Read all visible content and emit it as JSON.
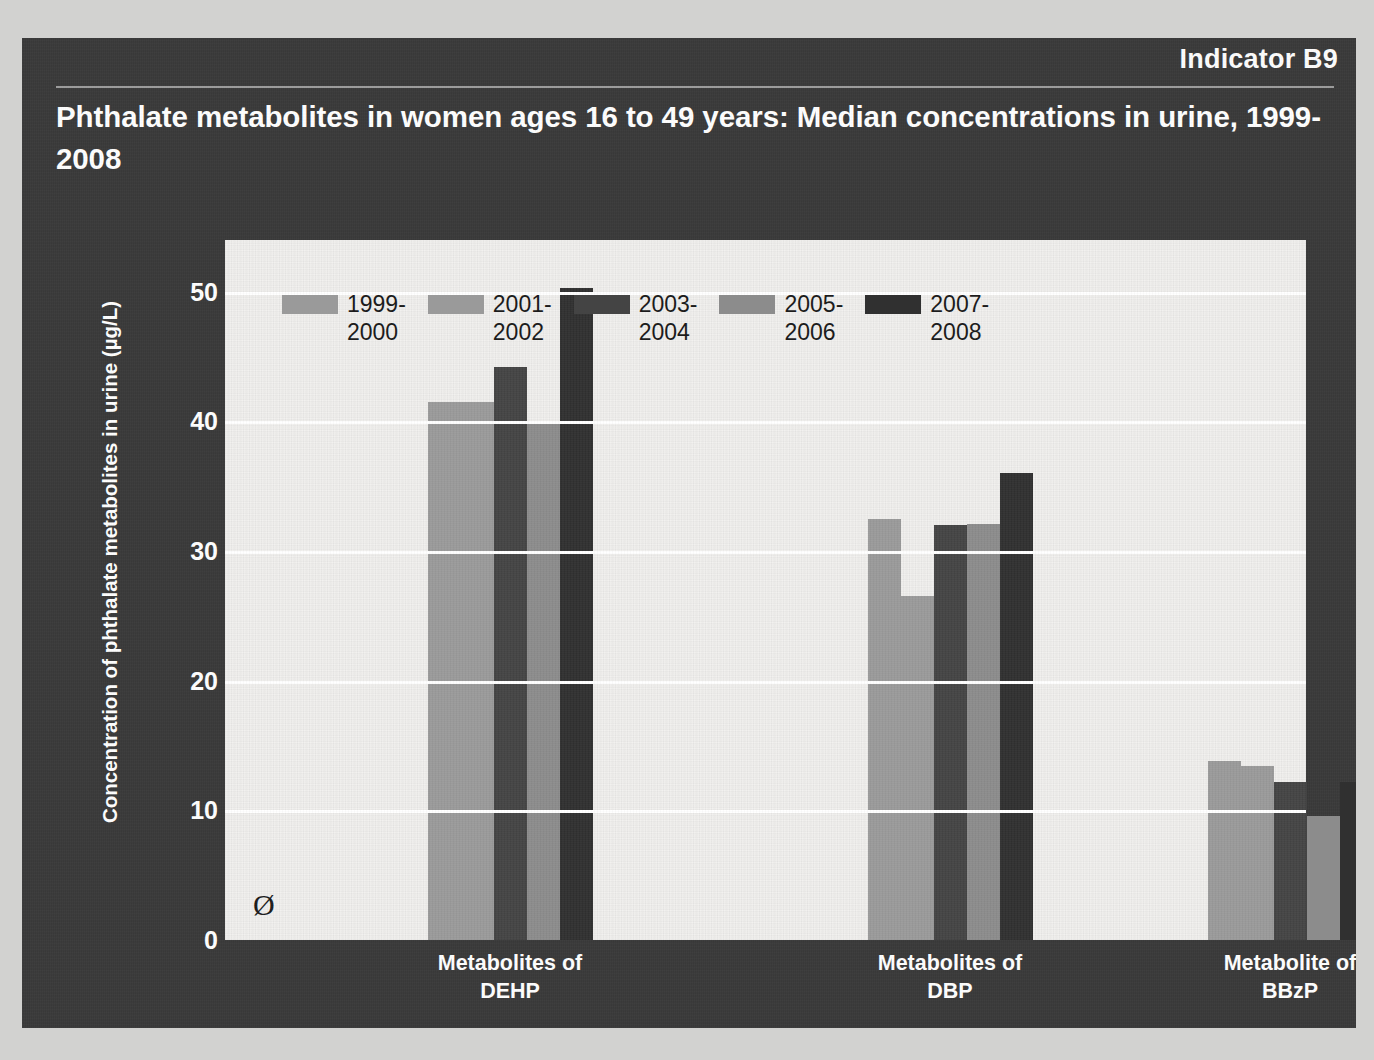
{
  "header": {
    "indicator": "Indicator B9",
    "title": "Phthalate metabolites in women ages 16 to 49 years: Median concentrations in urine, 1999-2008"
  },
  "zero_marker": "Ø",
  "colors": {
    "slide_background": "#3a3a3a",
    "plot_background": "#f2f1ef",
    "gridline": "#ffffff",
    "text_light": "#ffffff",
    "text_dark": "#1c1c1c",
    "series": [
      "#9a9a9a",
      "#9a9a9a",
      "#444444",
      "#8c8c8c",
      "#303030"
    ]
  },
  "chart_data": {
    "type": "bar",
    "title": "Phthalate metabolites in women ages 16 to 49 years: Median concentrations in urine, 1999-2008",
    "xlabel": "",
    "ylabel": "Concentration of phthalate metabolites in urine (µg/L)",
    "ylim": [
      0,
      54
    ],
    "yticks": [
      0,
      10,
      20,
      30,
      40,
      50
    ],
    "ytick_labels": [
      "0",
      "10",
      "20",
      "30",
      "40",
      "50"
    ],
    "grid": true,
    "legend_position": "top",
    "categories": [
      "Metabolites of\nDEHP",
      "Metabolites of\nDBP",
      "Metabolite of\nBBzP"
    ],
    "series": [
      {
        "name": "1999-\n2000",
        "color": "#9a9a9a",
        "values": [
          41.5,
          32.5,
          13.8
        ]
      },
      {
        "name": "2001-\n2002",
        "color": "#9a9a9a",
        "values": [
          41.5,
          26.5,
          13.4
        ]
      },
      {
        "name": "2003-\n2004",
        "color": "#444444",
        "values": [
          44.2,
          32.0,
          12.2
        ]
      },
      {
        "name": "2005-\n2006",
        "color": "#8c8c8c",
        "values": [
          40.0,
          32.1,
          9.6
        ]
      },
      {
        "name": "2007-\n2008",
        "color": "#303030",
        "values": [
          50.3,
          36.0,
          12.2
        ]
      }
    ]
  }
}
